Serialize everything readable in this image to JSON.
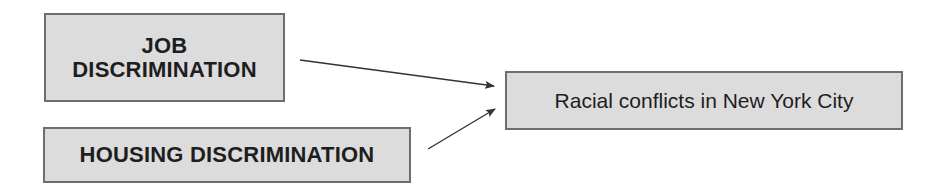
{
  "diagram": {
    "type": "cause-effect",
    "causes": [
      {
        "id": "job",
        "lines": [
          "JOB",
          "DISCRIMINATION"
        ]
      },
      {
        "id": "housing",
        "lines": [
          "HOUSING DISCRIMINATION"
        ]
      }
    ],
    "effect": {
      "id": "racial_conflicts",
      "label": "Racial conflicts in New York City"
    },
    "edges": [
      {
        "from": "job",
        "to": "racial_conflicts"
      },
      {
        "from": "housing",
        "to": "racial_conflicts"
      }
    ],
    "colors": {
      "box_fill": "#dcdcdc",
      "box_border": "#6e6e6e",
      "text": "#1e1e1e",
      "arrow": "#333333"
    }
  }
}
